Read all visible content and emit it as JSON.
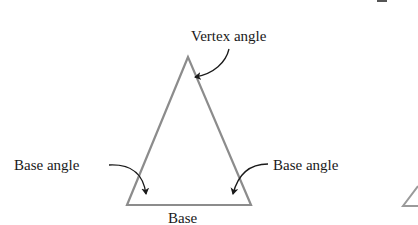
{
  "figure": {
    "shape": "isosceles-triangle",
    "colors": {
      "triangle_stroke": "#8c8c8c",
      "arrow": "#1a1a1a",
      "text": "#1a1a1a",
      "background": "#ffffff"
    },
    "vertices": {
      "apex": [
        188,
        57
      ],
      "base_left": [
        127,
        205
      ],
      "base_right": [
        251,
        205
      ]
    },
    "labels": {
      "vertex_angle": "Vertex angle",
      "base_angle_left": "Base angle",
      "base_angle_right": "Base angle",
      "base": "Base"
    },
    "annotations": [
      {
        "label": "Vertex angle",
        "points_to": "apex"
      },
      {
        "label": "Base angle",
        "points_to": "base_left"
      },
      {
        "label": "Base angle",
        "points_to": "base_right"
      },
      {
        "label": "Base",
        "points_to": "base-side"
      }
    ]
  }
}
